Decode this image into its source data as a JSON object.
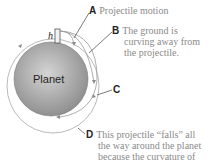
{
  "diagram": {
    "planet_label": "Planet",
    "height_label": "h",
    "colors": {
      "planet_light": "#d4d4d4",
      "planet_dark": "#8e8e8e",
      "orbit_line": "#9a9a9a",
      "label_letter": "#222222",
      "label_text": "#8a8a8a"
    },
    "callouts": [
      {
        "letter": "A",
        "lines": [
          "Projectile motion"
        ]
      },
      {
        "letter": "B",
        "lines": [
          "The ground is",
          "curving away from",
          "the projectile."
        ]
      },
      {
        "letter": "C",
        "lines": []
      },
      {
        "letter": "D",
        "lines": [
          "This projectile “falls” all",
          "the way around the planet",
          "because the curvature of"
        ]
      }
    ]
  }
}
